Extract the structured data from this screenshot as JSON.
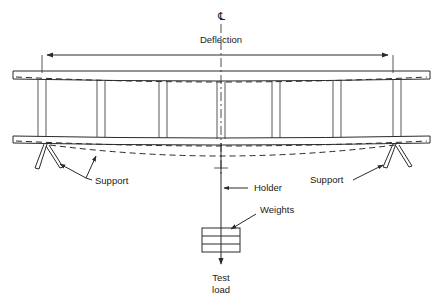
{
  "diagram": {
    "title_symbol": "℄",
    "labels": {
      "deflection": "Deflection",
      "support_left": "Support",
      "support_right": "Support",
      "holder": "Holder",
      "weights": "Weights",
      "test_load_line1": "Test",
      "test_load_line2": "load"
    },
    "colors": {
      "line": "#2a2a2a",
      "text": "#1a1a1a",
      "background": "#ffffff"
    },
    "geometry": {
      "canvas": {
        "width": 443,
        "height": 298
      },
      "centerline_x": 221,
      "top_rail": {
        "x1": 13,
        "x2": 430,
        "y_top": 71,
        "y_bottom": 79
      },
      "bottom_rail": {
        "x1": 13,
        "x2": 430,
        "y_top": 136,
        "y_bottom": 143
      },
      "rung_pairs_x": [
        [
          38,
          46
        ],
        [
          97,
          105
        ],
        [
          159,
          167
        ],
        [
          217,
          225
        ],
        [
          272,
          280
        ],
        [
          333,
          341
        ],
        [
          393,
          401
        ]
      ],
      "dimension_line_y": 55,
      "dimension_arrow_left_x": 42,
      "dimension_arrow_right_x": 393,
      "support_left_x": 50,
      "support_right_x": 395,
      "weights_box": {
        "x": 202,
        "y": 228,
        "width": 38,
        "height": 24,
        "plates": 3
      },
      "test_load_arrow_y": 262
    }
  }
}
